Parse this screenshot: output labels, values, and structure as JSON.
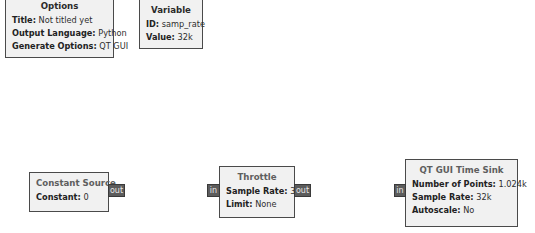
{
  "canvas": {
    "blocks": {
      "options": {
        "title": "Options",
        "params": [
          {
            "key": "Title:",
            "value": "Not titled yet"
          },
          {
            "key": "Output Language:",
            "value": "Python"
          },
          {
            "key": "Generate Options:",
            "value": "QT GUI"
          }
        ]
      },
      "variable": {
        "title": "Variable",
        "params": [
          {
            "key": "ID:",
            "value": "samp_rate"
          },
          {
            "key": "Value:",
            "value": "32k"
          }
        ]
      },
      "constant_source": {
        "title": "Constant Source",
        "params": [
          {
            "key": "Constant:",
            "value": "0"
          }
        ],
        "ports": {
          "out": "out"
        }
      },
      "throttle": {
        "title": "Throttle",
        "params": [
          {
            "key": "Sample Rate:",
            "value": "32k"
          },
          {
            "key": "Limit:",
            "value": "None"
          }
        ],
        "ports": {
          "in": "in",
          "out": "out"
        }
      },
      "time_sink": {
        "title": "QT GUI Time Sink",
        "params": [
          {
            "key": "Number of Points:",
            "value": "1.024k"
          },
          {
            "key": "Sample Rate:",
            "value": "32k"
          },
          {
            "key": "Autoscale:",
            "value": "No"
          }
        ],
        "ports": {
          "in": "in"
        }
      }
    },
    "colors": {
      "block_fill": "#f1f1f1",
      "block_border": "#4a4a4a",
      "port_fill": "#5c5c5c",
      "port_text": "#e8e8e8"
    }
  }
}
